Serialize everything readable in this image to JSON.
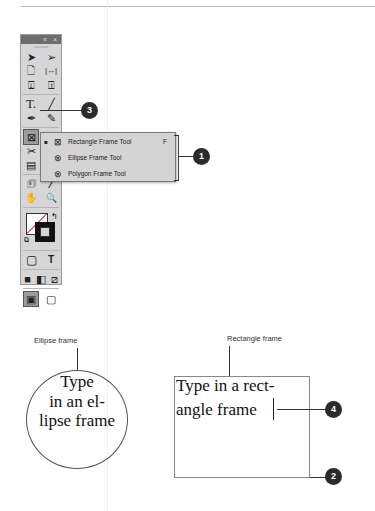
{
  "toolbox": {
    "title_buttons": {
      "collapse": "«",
      "close": "×"
    },
    "rows": [
      [
        "selection-tool",
        "direct-selection-tool"
      ],
      [
        "page-tool",
        "gap-tool"
      ],
      [
        "content-collector-tool",
        "content-placer-tool"
      ],
      [
        "type-tool",
        "line-tool"
      ],
      [
        "pen-tool",
        "pencil-tool"
      ],
      [
        "rectangle-frame-tool",
        "rectangle-tool"
      ],
      [
        "scissors-tool",
        "free-transform-tool"
      ],
      [
        "gradient-swatch-tool",
        "gradient-feather-tool"
      ],
      [
        "note-tool",
        "eyedropper-tool"
      ],
      [
        "hand-tool",
        "zoom-tool"
      ]
    ],
    "glyphs": {
      "selection": "➤",
      "direct_selection": "➢",
      "page": "🗋",
      "gap": "|↔|",
      "collector": "⍗",
      "placer": "⍐",
      "type": "T.",
      "line": "╱",
      "pen": "✒",
      "pencil": "✎",
      "frame": "⊠",
      "scissors": "✂",
      "gradient": "▤",
      "note": "🗊",
      "eyedropper": "⁄",
      "hand": "✋",
      "zoom": "🔍",
      "formatting_container": "▢",
      "formatting_text": "T",
      "apply_color": "■",
      "apply_gradient": "◧",
      "apply_none": "⧄",
      "normal_view": "▣",
      "preview_mode": "▢"
    }
  },
  "flyout": {
    "items": [
      {
        "label": "Rectangle Frame Tool",
        "shortcut": "F",
        "selected": true,
        "icon": "⊠"
      },
      {
        "label": "Ellipse Frame Tool",
        "shortcut": "",
        "selected": false,
        "icon": "⊗"
      },
      {
        "label": "Polygon Frame Tool",
        "shortcut": "",
        "selected": false,
        "icon": "⊗"
      }
    ],
    "bullet": "■"
  },
  "callouts": {
    "c1": "1",
    "c2": "2",
    "c3": "3",
    "c4": "4"
  },
  "illustrations": {
    "ellipse_label": "Ellipse frame",
    "ellipse_lines": [
      "Type",
      "in an el-",
      "lipse frame"
    ],
    "rect_label": "Rectangle frame",
    "rect_lines": [
      "Type in a rect-",
      "angle frame"
    ]
  }
}
